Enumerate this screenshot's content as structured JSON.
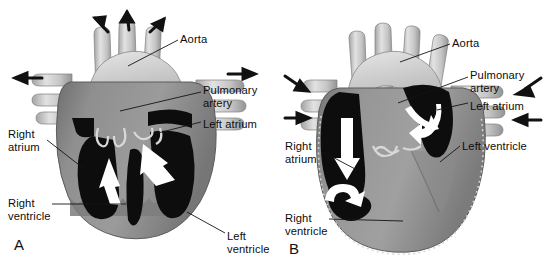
{
  "figure": {
    "width": 550,
    "height": 261,
    "background": "#ffffff"
  },
  "colors": {
    "myocardium": "#8d8d8d",
    "myocardium_dark": "#6f6f6f",
    "myocardium_light": "#a8a8a8",
    "chamber_blood": "#0d0d0d",
    "vessel": "#c9c9c9",
    "vessel_light": "#dcdcdc",
    "vessel_shadow": "#9a9a9a",
    "arrow_white": "#ffffff",
    "arrow_black": "#111111",
    "leader_line": "#141414",
    "text": "#0d0d0d"
  },
  "panels": [
    {
      "id": "A",
      "letter": "A",
      "phase": "ventricular systole",
      "letter_pos": {
        "x": 14,
        "y": 236
      },
      "labels": [
        {
          "name": "aorta",
          "text": "Aorta",
          "x": 180,
          "y": 33,
          "lines": 1
        },
        {
          "name": "pulmonary-artery",
          "text": "Pulmonary\nartery",
          "x": 203,
          "y": 84,
          "lines": 2
        },
        {
          "name": "left-atrium",
          "text": "Left atrium",
          "x": 203,
          "y": 118,
          "lines": 1
        },
        {
          "name": "right-atrium",
          "text": "Right\natrium",
          "x": 8,
          "y": 128,
          "lines": 2
        },
        {
          "name": "right-ventricle",
          "text": "Right\nventricle",
          "x": 8,
          "y": 197,
          "lines": 2
        },
        {
          "name": "left-ventricle",
          "text": "Left\nventricle",
          "x": 227,
          "y": 230,
          "lines": 2
        }
      ],
      "leaders": [
        {
          "name": "leader-aorta",
          "x1": 178,
          "y1": 40,
          "x2": 128,
          "y2": 66
        },
        {
          "name": "leader-pulmonary-artery",
          "x1": 201,
          "y1": 92,
          "x2": 120,
          "y2": 111
        },
        {
          "name": "leader-left-atrium",
          "x1": 201,
          "y1": 122,
          "x2": 158,
          "y2": 133
        },
        {
          "name": "leader-right-atrium",
          "x1": 47,
          "y1": 140,
          "x2": 83,
          "y2": 168
        },
        {
          "name": "leader-right-ventricle",
          "x1": 52,
          "y1": 204,
          "x2": 126,
          "y2": 204
        },
        {
          "name": "leader-left-ventricle",
          "x1": 225,
          "y1": 233,
          "x2": 187,
          "y2": 212
        }
      ],
      "flow_arrows_outward": [
        {
          "name": "arrow-out-aorta-left",
          "x": 98,
          "y": 22,
          "angle": -62
        },
        {
          "name": "arrow-out-aorta-mid",
          "x": 129,
          "y": 16,
          "angle": -82
        },
        {
          "name": "arrow-out-aorta-right",
          "x": 160,
          "y": 22,
          "angle": -55
        },
        {
          "name": "arrow-out-vena-cava",
          "x": 24,
          "y": 78,
          "angle": 185
        },
        {
          "name": "arrow-out-pulm-veins",
          "x": 245,
          "y": 74,
          "angle": 0
        }
      ],
      "chamber_arrows": [
        {
          "name": "arrow-rv-ejection",
          "description": "white arrow up out of right ventricle"
        },
        {
          "name": "arrow-lv-ejection",
          "description": "white arrow up out of left ventricle"
        }
      ],
      "ventricles_filled": false,
      "atria_filled": false
    },
    {
      "id": "B",
      "letter": "B",
      "phase": "ventricular diastole / atrial filling",
      "letter_pos": {
        "x": 289,
        "y": 240
      },
      "labels": [
        {
          "name": "aorta",
          "text": "Aorta",
          "x": 452,
          "y": 37,
          "lines": 1
        },
        {
          "name": "pulmonary-artery",
          "text": "Pulmonary\nartery",
          "x": 470,
          "y": 69,
          "lines": 2
        },
        {
          "name": "left-atrium",
          "text": "Left atrium",
          "x": 470,
          "y": 100,
          "lines": 1
        },
        {
          "name": "left-ventricle",
          "text": "Left ventricle",
          "x": 462,
          "y": 140,
          "lines": 1
        },
        {
          "name": "right-atrium",
          "text": "Right\natrium",
          "x": 285,
          "y": 140,
          "lines": 2
        },
        {
          "name": "right-ventricle",
          "text": "Right\nventricle",
          "x": 285,
          "y": 212,
          "lines": 2
        }
      ],
      "leaders": [
        {
          "name": "leader-aorta",
          "x1": 450,
          "y1": 44,
          "x2": 400,
          "y2": 62
        },
        {
          "name": "leader-pulmonary-artery",
          "x1": 468,
          "y1": 77,
          "x2": 398,
          "y2": 103
        },
        {
          "name": "leader-left-atrium",
          "x1": 468,
          "y1": 103,
          "x2": 437,
          "y2": 110
        },
        {
          "name": "leader-left-ventricle",
          "x1": 460,
          "y1": 146,
          "x2": 440,
          "y2": 162
        },
        {
          "name": "leader-right-atrium",
          "x1": 323,
          "y1": 152,
          "x2": 357,
          "y2": 170
        },
        {
          "name": "leader-right-ventricle",
          "x1": 329,
          "y1": 219,
          "x2": 403,
          "y2": 221
        }
      ],
      "flow_arrows_inward": [
        {
          "name": "arrow-in-svc",
          "x": 300,
          "y": 84,
          "angle": 30
        },
        {
          "name": "arrow-in-ivc",
          "x": 300,
          "y": 115,
          "angle": 0
        },
        {
          "name": "arrow-in-pulm-vein-up",
          "x": 540,
          "y": 87,
          "angle": 205
        },
        {
          "name": "arrow-in-pulm-vein-lo",
          "x": 540,
          "y": 117,
          "angle": 180
        }
      ],
      "chamber_arrows": [
        {
          "name": "arrow-ra-filling",
          "description": "white arrow down through right atrium"
        },
        {
          "name": "arrow-ra-to-rv",
          "description": "white curved arrow right atrium into right ventricle"
        },
        {
          "name": "arrow-la-filling",
          "description": "white curved arrows in left atrium"
        }
      ],
      "ventricles_filled": true,
      "atria_filled": true
    }
  ]
}
